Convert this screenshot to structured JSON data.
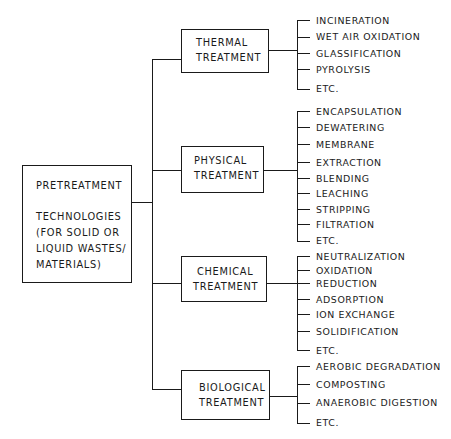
{
  "root": {
    "title": "PRETREATMENT",
    "lines": [
      "TECHNOLOGIES",
      "(FOR  SOLID  OR",
      "LIQUID  WASTES/",
      "MATERIALS)"
    ]
  },
  "categories": [
    {
      "label_1": "THERMAL",
      "label_2": "TREATMENT",
      "items": [
        "INCINERATION",
        "WET  AIR  OXIDATION",
        "GLASSIFICATION",
        "PYROLYSIS",
        "ETC."
      ]
    },
    {
      "label_1": "PHYSICAL",
      "label_2": "TREATMENT",
      "items": [
        "ENCAPSULATION",
        "DEWATERING",
        "MEMBRANE",
        "EXTRACTION",
        "BLENDING",
        "LEACHING",
        "STRIPPING",
        "FILTRATION",
        "ETC."
      ]
    },
    {
      "label_1": "CHEMICAL",
      "label_2": "TREATMENT",
      "items": [
        "NEUTRALIZATION",
        "OXIDATION",
        "REDUCTION",
        "ADSORPTION",
        "ION   EXCHANGE",
        "SOLIDIFICATION",
        "ETC."
      ]
    },
    {
      "label_1": "BIOLOGICAL",
      "label_2": "TREATMENT",
      "items": [
        "AEROBIC  DEGRADATION",
        "COMPOSTING",
        "ANAEROBIC  DIGESTION",
        "ETC."
      ]
    }
  ]
}
